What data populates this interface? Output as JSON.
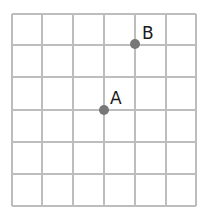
{
  "grid": {
    "columns": 6,
    "rows": 6,
    "x_lines": [
      12,
      42,
      73,
      104,
      135,
      166,
      196
    ],
    "y_lines": [
      14,
      45,
      77,
      110,
      142,
      174,
      206
    ],
    "line_color": "#bdbdbd",
    "line_width": 2
  },
  "points": [
    {
      "name": "A",
      "label": "A",
      "grid_x": 3,
      "grid_y": 3,
      "x": 104,
      "y": 110,
      "label_x": 110,
      "label_y": 104,
      "color": "#777777"
    },
    {
      "name": "B",
      "label": "B",
      "grid_x": 4,
      "grid_y": 1,
      "x": 135,
      "y": 44,
      "label_x": 142,
      "label_y": 39,
      "color": "#777777"
    }
  ]
}
